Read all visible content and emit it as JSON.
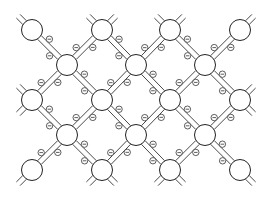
{
  "diagram": {
    "atom_radius": 10.5,
    "electron_radius": 3.2,
    "electron_symbol": "⊖",
    "stroke_color": "#333333",
    "atoms": [
      {
        "id": "a00",
        "x": 32,
        "y": 30
      },
      {
        "id": "a01",
        "x": 102,
        "y": 30
      },
      {
        "id": "a02",
        "x": 170,
        "y": 30
      },
      {
        "id": "a03",
        "x": 240,
        "y": 30
      },
      {
        "id": "a10",
        "x": 67,
        "y": 65
      },
      {
        "id": "a11",
        "x": 136,
        "y": 65
      },
      {
        "id": "a12",
        "x": 205,
        "y": 65
      },
      {
        "id": "a20",
        "x": 32,
        "y": 100
      },
      {
        "id": "a21",
        "x": 102,
        "y": 100
      },
      {
        "id": "a22",
        "x": 170,
        "y": 100
      },
      {
        "id": "a23",
        "x": 240,
        "y": 100
      },
      {
        "id": "a30",
        "x": 67,
        "y": 135
      },
      {
        "id": "a31",
        "x": 136,
        "y": 135
      },
      {
        "id": "a32",
        "x": 205,
        "y": 135
      },
      {
        "id": "a40",
        "x": 32,
        "y": 170
      },
      {
        "id": "a41",
        "x": 102,
        "y": 170
      },
      {
        "id": "a42",
        "x": 170,
        "y": 170
      },
      {
        "id": "a43",
        "x": 240,
        "y": 170
      }
    ],
    "bonds": [
      [
        "a00",
        "a10"
      ],
      [
        "a01",
        "a10"
      ],
      [
        "a01",
        "a11"
      ],
      [
        "a02",
        "a11"
      ],
      [
        "a02",
        "a12"
      ],
      [
        "a03",
        "a12"
      ],
      [
        "a10",
        "a20"
      ],
      [
        "a10",
        "a21"
      ],
      [
        "a11",
        "a21"
      ],
      [
        "a11",
        "a22"
      ],
      [
        "a12",
        "a22"
      ],
      [
        "a12",
        "a23"
      ],
      [
        "a20",
        "a30"
      ],
      [
        "a21",
        "a30"
      ],
      [
        "a21",
        "a31"
      ],
      [
        "a22",
        "a31"
      ],
      [
        "a22",
        "a32"
      ],
      [
        "a23",
        "a32"
      ],
      [
        "a30",
        "a40"
      ],
      [
        "a30",
        "a41"
      ],
      [
        "a31",
        "a41"
      ],
      [
        "a31",
        "a42"
      ],
      [
        "a32",
        "a42"
      ],
      [
        "a32",
        "a43"
      ]
    ],
    "stubs": [
      {
        "atom": "a00",
        "dirs": [
          [
            -1,
            -1
          ]
        ]
      },
      {
        "atom": "a01",
        "dirs": [
          [
            -1,
            -1
          ],
          [
            1,
            -1
          ]
        ]
      },
      {
        "atom": "a02",
        "dirs": [
          [
            -1,
            -1
          ],
          [
            1,
            -1
          ]
        ]
      },
      {
        "atom": "a03",
        "dirs": [
          [
            1,
            -1
          ]
        ]
      },
      {
        "atom": "a20",
        "dirs": [
          [
            -1,
            -1
          ],
          [
            -1,
            1
          ]
        ]
      },
      {
        "atom": "a23",
        "dirs": [
          [
            1,
            -1
          ],
          [
            1,
            1
          ]
        ]
      },
      {
        "atom": "a40",
        "dirs": [
          [
            -1,
            1
          ]
        ]
      },
      {
        "atom": "a41",
        "dirs": [
          [
            -1,
            1
          ],
          [
            1,
            1
          ]
        ]
      },
      {
        "atom": "a42",
        "dirs": [
          [
            -1,
            1
          ],
          [
            1,
            1
          ]
        ]
      },
      {
        "atom": "a43",
        "dirs": [
          [
            1,
            1
          ]
        ]
      }
    ]
  }
}
